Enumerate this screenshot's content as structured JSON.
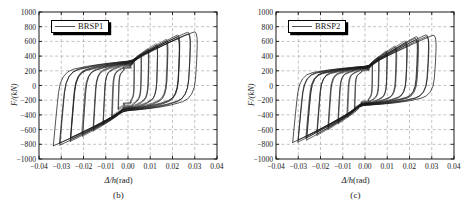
{
  "figure": {
    "panels": [
      {
        "caption": "(b)",
        "legend_label": "BRSP1",
        "legend_line_color": "#4a4a4a",
        "xlabel_symbol": "Δ/h",
        "xlabel_unit": "(rad)",
        "ylabel": "F/(kN)",
        "chart_key": "brsp1"
      },
      {
        "caption": "(c)",
        "legend_label": "BRSP2",
        "legend_line_color": "#4a4a4a",
        "xlabel_symbol": "Δ/h",
        "xlabel_unit": "(rad)",
        "ylabel": "F/(kN)",
        "chart_key": "brsp2"
      }
    ]
  },
  "chart_data": [
    {
      "id": "brsp1",
      "type": "line",
      "title": "(b)",
      "xlabel": "Δ/h(rad)",
      "ylabel": "F/kN",
      "legend": [
        "BRSP1"
      ],
      "legend_position": "top-left",
      "grid": true,
      "xlim": [
        -0.04,
        0.04
      ],
      "ylim": [
        -1000,
        1000
      ],
      "xticks": [
        -0.04,
        -0.03,
        -0.02,
        -0.01,
        0.0,
        0.01,
        0.02,
        0.03,
        0.04
      ],
      "xticklabels": [
        "−0.04",
        "−0.03",
        "−0.02",
        "−0.01",
        "0.00",
        "0.01",
        "0.02",
        "0.03",
        "0.04"
      ],
      "yticks": [
        -1000,
        -800,
        -600,
        -400,
        -200,
        0,
        200,
        400,
        600,
        800,
        1000
      ],
      "yticklabels": [
        "−1000",
        "−800",
        "−600",
        "−400",
        "−200",
        "0",
        "200",
        "400",
        "600",
        "800",
        "1000"
      ],
      "line_color": "#1a1a1a",
      "description": "Cyclic hysteresis loops of buckling-restrained steel plate BRSP1, force versus drift ratio",
      "cycles": [
        {
          "amp_pos": 0.003,
          "amp_neg": -0.0042,
          "f_pos": 330,
          "f_neg": -330,
          "f_yield_pos": 250,
          "f_yield_neg": -250,
          "repeats": 3
        },
        {
          "amp_pos": 0.006,
          "amp_neg": -0.0072,
          "f_pos": 430,
          "f_neg": -440,
          "f_yield_pos": 280,
          "f_yield_neg": -290,
          "repeats": 3
        },
        {
          "amp_pos": 0.0095,
          "amp_neg": -0.011,
          "f_pos": 510,
          "f_neg": -530,
          "f_yield_pos": 300,
          "f_yield_neg": -310,
          "repeats": 3
        },
        {
          "amp_pos": 0.0135,
          "amp_neg": -0.0155,
          "f_pos": 580,
          "f_neg": -620,
          "f_yield_pos": 310,
          "f_yield_neg": -320,
          "repeats": 3
        },
        {
          "amp_pos": 0.018,
          "amp_neg": -0.0205,
          "f_pos": 640,
          "f_neg": -690,
          "f_yield_pos": 320,
          "f_yield_neg": -330,
          "repeats": 3
        },
        {
          "amp_pos": 0.0235,
          "amp_neg": -0.0258,
          "f_pos": 700,
          "f_neg": -760,
          "f_yield_pos": 325,
          "f_yield_neg": -335,
          "repeats": 3
        },
        {
          "amp_pos": 0.0285,
          "amp_neg": -0.0305,
          "f_pos": 740,
          "f_neg": -810,
          "f_yield_pos": 330,
          "f_yield_neg": -340,
          "repeats": 2
        },
        {
          "amp_pos": 0.0312,
          "amp_neg": -0.0332,
          "f_pos": 745,
          "f_neg": -820,
          "f_yield_pos": 330,
          "f_yield_neg": -340,
          "repeats": 1
        }
      ],
      "peak_force_positive": 745,
      "peak_force_negative": -820,
      "peak_drift_positive": 0.0312,
      "peak_drift_negative": -0.0332
    },
    {
      "id": "brsp2",
      "type": "line",
      "title": "(c)",
      "xlabel": "Δ/h(rad)",
      "ylabel": "F/kN",
      "legend": [
        "BRSP2"
      ],
      "legend_position": "top-left",
      "grid": true,
      "xlim": [
        -0.04,
        0.04
      ],
      "ylim": [
        -1000,
        1000
      ],
      "xticks": [
        -0.04,
        -0.03,
        -0.02,
        -0.01,
        0.0,
        0.01,
        0.02,
        0.03,
        0.04
      ],
      "xticklabels": [
        "−0.04",
        "−0.03",
        "−0.02",
        "−0.01",
        "0.00",
        "0.01",
        "0.02",
        "0.03",
        "0.04"
      ],
      "yticks": [
        -1000,
        -800,
        -600,
        -400,
        -200,
        0,
        200,
        400,
        600,
        800,
        1000
      ],
      "yticklabels": [
        "−1000",
        "−800",
        "−600",
        "−400",
        "−200",
        "0",
        "200",
        "400",
        "600",
        "800",
        "1000"
      ],
      "line_color": "#1a1a1a",
      "description": "Cyclic hysteresis loops of buckling-restrained steel plate BRSP2, force versus drift ratio",
      "cycles": [
        {
          "amp_pos": 0.0032,
          "amp_neg": -0.0048,
          "f_pos": 300,
          "f_neg": -320,
          "f_yield_pos": 215,
          "f_yield_neg": -225,
          "repeats": 3
        },
        {
          "amp_pos": 0.0062,
          "amp_neg": -0.008,
          "f_pos": 400,
          "f_neg": -430,
          "f_yield_pos": 235,
          "f_yield_neg": -245,
          "repeats": 3
        },
        {
          "amp_pos": 0.01,
          "amp_neg": -0.012,
          "f_pos": 480,
          "f_neg": -520,
          "f_yield_pos": 245,
          "f_yield_neg": -255,
          "repeats": 3
        },
        {
          "amp_pos": 0.0142,
          "amp_neg": -0.0165,
          "f_pos": 550,
          "f_neg": -600,
          "f_yield_pos": 250,
          "f_yield_neg": -258,
          "repeats": 3
        },
        {
          "amp_pos": 0.019,
          "amp_neg": -0.0215,
          "f_pos": 620,
          "f_neg": -680,
          "f_yield_pos": 255,
          "f_yield_neg": -262,
          "repeats": 3
        },
        {
          "amp_pos": 0.024,
          "amp_neg": -0.0262,
          "f_pos": 680,
          "f_neg": -740,
          "f_yield_pos": 258,
          "f_yield_neg": -265,
          "repeats": 3
        },
        {
          "amp_pos": 0.029,
          "amp_neg": -0.0302,
          "f_pos": 705,
          "f_neg": -770,
          "f_yield_pos": 260,
          "f_yield_neg": -268,
          "repeats": 2
        },
        {
          "amp_pos": 0.032,
          "amp_neg": -0.0322,
          "f_pos": 700,
          "f_neg": -775,
          "f_yield_pos": 260,
          "f_yield_neg": -268,
          "repeats": 1
        }
      ],
      "peak_force_positive": 705,
      "peak_force_negative": -775,
      "peak_drift_positive": 0.032,
      "peak_drift_negative": -0.0322
    }
  ]
}
